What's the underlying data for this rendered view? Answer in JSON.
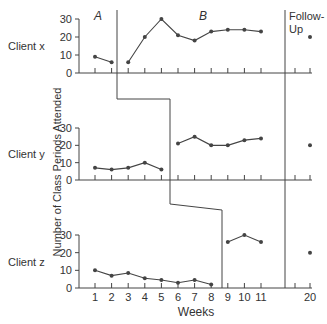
{
  "chart_data": {
    "type": "line",
    "title": "",
    "xlabel": "Weeks",
    "ylabel": "Number of Class Periods Attended",
    "x_ticks": [
      "1",
      "2",
      "3",
      "4",
      "5",
      "6",
      "7",
      "8",
      "9",
      "10",
      "11",
      "20"
    ],
    "y_ticks": [
      "0",
      "10",
      "20",
      "30"
    ],
    "ylim": [
      0,
      30
    ],
    "grid": false,
    "phase_labels": [
      "A",
      "B",
      "Follow-Up"
    ],
    "panels": [
      {
        "name": "Client x",
        "baseline": {
          "weeks": [
            1,
            2
          ],
          "values": [
            9,
            6
          ]
        },
        "treatment": {
          "weeks": [
            3,
            4,
            5,
            6,
            7,
            8,
            9,
            10,
            11
          ],
          "values": [
            6,
            20,
            30,
            21,
            18,
            23,
            24,
            24,
            23
          ]
        },
        "follow_up": {
          "weeks": [
            20
          ],
          "values": [
            20
          ]
        }
      },
      {
        "name": "Client y",
        "baseline": {
          "weeks": [
            1,
            2,
            3,
            4,
            5
          ],
          "values": [
            7,
            6,
            7,
            10,
            6
          ]
        },
        "treatment": {
          "weeks": [
            6,
            7,
            8,
            9,
            10,
            11
          ],
          "values": [
            21,
            25,
            20,
            20,
            23,
            24
          ]
        },
        "follow_up": {
          "weeks": [
            20
          ],
          "values": [
            20
          ]
        }
      },
      {
        "name": "Client z",
        "baseline": {
          "weeks": [
            1,
            2,
            3,
            4,
            5,
            6,
            7,
            8
          ],
          "values": [
            10,
            7,
            8.5,
            5.5,
            4.5,
            3,
            4.5,
            2
          ]
        },
        "treatment": {
          "weeks": [
            9,
            10,
            11
          ],
          "values": [
            26,
            30,
            26
          ]
        },
        "follow_up": {
          "weeks": [
            20
          ],
          "values": [
            20
          ]
        }
      }
    ]
  }
}
